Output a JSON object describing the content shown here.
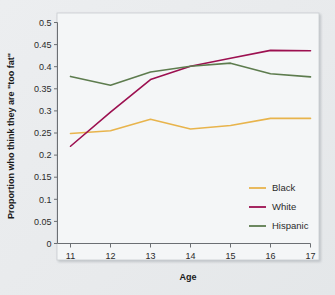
{
  "chart_data": {
    "type": "line",
    "title": "",
    "xlabel": "Age",
    "ylabel": "Proportion who think they are \"too fat\"",
    "x": [
      11,
      12,
      13,
      14,
      15,
      16,
      17
    ],
    "xticklabels": [
      "11",
      "12",
      "13",
      "14",
      "15",
      "16",
      "17"
    ],
    "yticklabels": [
      "0",
      "0.05",
      "0.1",
      "0.15",
      "0.2",
      "0.25",
      "0.3",
      "0.35",
      "0.4",
      "0.45",
      "0.5"
    ],
    "yticks": [
      0,
      0.05,
      0.1,
      0.15,
      0.2,
      0.25,
      0.3,
      0.35,
      0.4,
      0.45,
      0.5
    ],
    "xlim": [
      11,
      17
    ],
    "ylim": [
      0,
      0.5
    ],
    "grid": false,
    "legend_position": "center-right",
    "series": [
      {
        "name": "Black",
        "color": "#e8b44c",
        "values": [
          0.249,
          0.255,
          0.281,
          0.259,
          0.267,
          0.283,
          0.283
        ]
      },
      {
        "name": "White",
        "color": "#9c1050",
        "values": [
          0.22,
          0.297,
          0.371,
          0.401,
          0.419,
          0.437,
          0.436
        ]
      },
      {
        "name": "Hispanic",
        "color": "#5d7c4e",
        "values": [
          0.378,
          0.358,
          0.388,
          0.401,
          0.408,
          0.384,
          0.377
        ]
      }
    ]
  },
  "legend": {
    "items": [
      {
        "label": "Black"
      },
      {
        "label": "White"
      },
      {
        "label": "Hispanic"
      }
    ]
  },
  "axes": {
    "x_title": "Age",
    "y_title": "Proportion who think they are \"too fat\""
  }
}
